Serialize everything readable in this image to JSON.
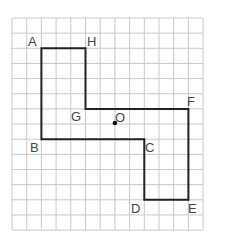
{
  "diagram": {
    "type": "grid-polygon",
    "grid": {
      "columns": 13,
      "rows": 14,
      "line_color": "#c8c8c8"
    },
    "polygon": {
      "stroke_color": "#222222",
      "vertices": [
        {
          "label": "A",
          "col": 2,
          "row": 2
        },
        {
          "label": "H",
          "col": 5,
          "row": 2
        },
        {
          "label": "G",
          "col": 5,
          "row": 6
        },
        {
          "label": "F",
          "col": 12,
          "row": 6
        },
        {
          "label": "E",
          "col": 12,
          "row": 12
        },
        {
          "label": "D",
          "col": 9,
          "row": 12
        },
        {
          "label": "C",
          "col": 9,
          "row": 8
        },
        {
          "label": "B",
          "col": 2,
          "row": 8
        }
      ]
    },
    "center_point": {
      "label": "O",
      "col": 7,
      "row": 7
    }
  },
  "labels": {
    "A": "A",
    "H": "H",
    "G": "G",
    "F": "F",
    "E": "E",
    "D": "D",
    "C": "C",
    "B": "B",
    "O": "O"
  }
}
